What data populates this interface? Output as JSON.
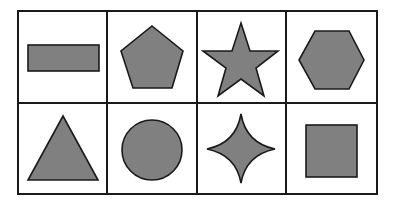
{
  "grid": {
    "rows": 2,
    "cols": 4,
    "left": 18,
    "top": 11,
    "right": 377,
    "bottom": 194,
    "col_x": [
      18,
      107,
      197,
      286,
      377
    ],
    "row_y": [
      11,
      103,
      194
    ],
    "line_color": "#1a1a1a",
    "fill_color": "#808080",
    "stroke_color": "#1a1a1a"
  },
  "cells": [
    {
      "row": 0,
      "col": 0,
      "shape": "rectangle"
    },
    {
      "row": 0,
      "col": 1,
      "shape": "pentagon"
    },
    {
      "row": 0,
      "col": 2,
      "shape": "star"
    },
    {
      "row": 0,
      "col": 3,
      "shape": "hexagon"
    },
    {
      "row": 1,
      "col": 0,
      "shape": "triangle"
    },
    {
      "row": 1,
      "col": 1,
      "shape": "circle"
    },
    {
      "row": 1,
      "col": 2,
      "shape": "four-point-star"
    },
    {
      "row": 1,
      "col": 3,
      "shape": "square"
    }
  ]
}
